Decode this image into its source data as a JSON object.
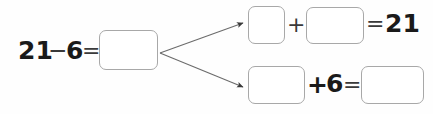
{
  "worksheet": {
    "type": "math-fact-family-diagram",
    "background_color": "#fefefe",
    "box_border_color": "#a8a8a8",
    "text_color": "#1a1a1a"
  },
  "left_expression": {
    "minuend": "21",
    "minus_sign": "−",
    "subtrahend": "6",
    "equals_sign": "=",
    "answer_box_value": ""
  },
  "top_expression": {
    "first_box_value": "",
    "plus_sign": "+",
    "second_box_value": "",
    "equals_sign": "=",
    "sum": "21"
  },
  "bottom_expression": {
    "first_box_value": "",
    "plus_sign": "+",
    "addend": "6",
    "equals_sign": "=",
    "answer_box_value": ""
  },
  "arrows": [
    {
      "name": "arrow-to-top-expression",
      "from_x": 160,
      "from_y": 53,
      "to_x": 245,
      "to_y": 22
    },
    {
      "name": "arrow-to-bottom-expression",
      "from_x": 160,
      "from_y": 53,
      "to_x": 245,
      "to_y": 88
    }
  ]
}
